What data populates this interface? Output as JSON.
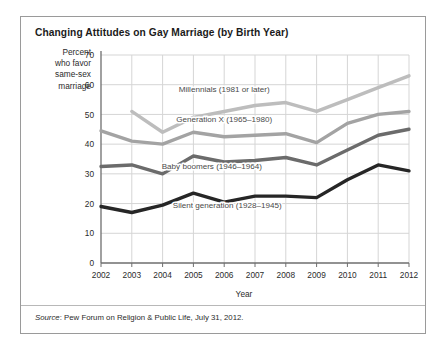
{
  "figure": {
    "title": "Changing Attitudes on Gay Marriage (by Birth Year)",
    "y_axis_caption_lines": [
      "Percent",
      "who favor",
      "same-sex",
      "marriage"
    ],
    "x_axis_title": "Year",
    "source_prefix": "Source",
    "source_text": ": Pew Forum on Religion & Public Life, July 31, 2012.",
    "border_color": "#9a9a9a",
    "grid_color": "#d5d5d5",
    "axis_color": "#6e6e6e",
    "background": "#ffffff"
  },
  "chart_data": {
    "type": "line",
    "title": "Changing Attitudes on Gay Marriage (by Birth Year)",
    "subtitle": "",
    "xlabel": "Year",
    "ylabel": "Percent who favor same-sex marriage",
    "x": [
      2002,
      2003,
      2004,
      2005,
      2006,
      2007,
      2008,
      2009,
      2010,
      2011,
      2012
    ],
    "tick_labels_x": [
      "2002",
      "2003",
      "2004",
      "2005",
      "2006",
      "2007",
      "2008",
      "2009",
      "2010",
      "2011",
      "2012"
    ],
    "tick_labels_y": [
      "0",
      "10",
      "20",
      "30",
      "40",
      "50",
      "60",
      "70"
    ],
    "ylim": [
      0,
      70
    ],
    "xlim": [
      2002,
      2012
    ],
    "grid": true,
    "legend_position": "inline-annotations",
    "series": [
      {
        "name": "Millennials (1981 or later)",
        "label": "Millennials (1981 or later)",
        "color": "#bdbdbd",
        "x": [
          2003,
          2004,
          2005,
          2006,
          2007,
          2008,
          2009,
          2010,
          2011,
          2012
        ],
        "values": [
          51,
          44,
          49,
          51,
          53,
          54,
          51,
          55,
          59,
          63
        ]
      },
      {
        "name": "Generation X (1965-1980)",
        "label": "Generation X (1965–1980)",
        "color": "#a3a3a3",
        "x": [
          2002,
          2003,
          2004,
          2005,
          2006,
          2007,
          2008,
          2009,
          2010,
          2011,
          2012
        ],
        "values": [
          44.5,
          41,
          40,
          44,
          42.5,
          43,
          43.5,
          40.5,
          47,
          50,
          51
        ]
      },
      {
        "name": "Baby boomers (1946-1964)",
        "label": "Baby boomers (1946–1964)",
        "color": "#6b6b6b",
        "x": [
          2002,
          2003,
          2004,
          2005,
          2006,
          2007,
          2008,
          2009,
          2010,
          2011,
          2012
        ],
        "values": [
          32.5,
          33,
          30,
          36,
          34,
          34.5,
          35.5,
          33,
          38,
          43,
          45
        ]
      },
      {
        "name": "Silent generation (1928-1945)",
        "label": "Silent generation (1928–1945)",
        "color": "#262626",
        "x": [
          2002,
          2003,
          2004,
          2005,
          2006,
          2007,
          2008,
          2009,
          2010,
          2011,
          2012
        ],
        "values": [
          19,
          17,
          19.5,
          23.5,
          20.5,
          22.5,
          22.5,
          22,
          28,
          33,
          31
        ]
      }
    ],
    "annotations": [
      {
        "text": "Millennials (1981 or later)",
        "x": 2006,
        "y": 57.5
      },
      {
        "text": "Generation X (1965–1980)",
        "x": 2006,
        "y": 47.5
      },
      {
        "text": "Baby boomers (1946–1964)",
        "x": 2005.6,
        "y": 31.5
      },
      {
        "text": "Silent generation (1928–1945)",
        "x": 2006.1,
        "y": 18.5
      }
    ]
  }
}
